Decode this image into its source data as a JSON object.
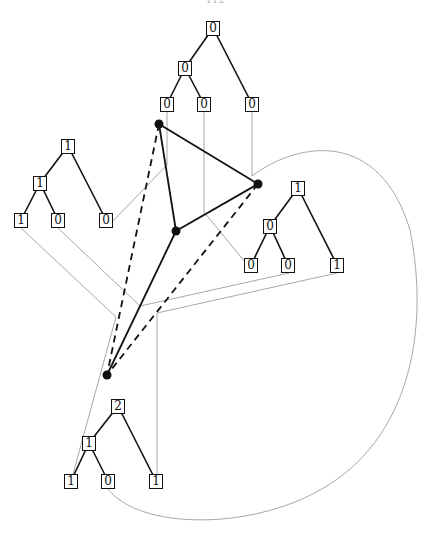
{
  "header": {
    "page_label": "112"
  },
  "colors": {
    "tree_edge": "#111111",
    "connector": "#a8a8a8",
    "graph_edge": "#111111",
    "vertex": "#111111"
  },
  "trees": [
    {
      "id": "top",
      "nodes": [
        {
          "label": "0",
          "x": 213,
          "y": 28
        },
        {
          "label": "0",
          "x": 185,
          "y": 68
        },
        {
          "label": "0",
          "x": 167,
          "y": 104
        },
        {
          "label": "0",
          "x": 204,
          "y": 104
        },
        {
          "label": "0",
          "x": 252,
          "y": 104
        }
      ],
      "edges": [
        [
          0,
          1
        ],
        [
          0,
          4
        ],
        [
          1,
          2
        ],
        [
          1,
          3
        ]
      ]
    },
    {
      "id": "left",
      "nodes": [
        {
          "label": "1",
          "x": 68,
          "y": 146
        },
        {
          "label": "1",
          "x": 40,
          "y": 183
        },
        {
          "label": "1",
          "x": 21,
          "y": 220
        },
        {
          "label": "0",
          "x": 58,
          "y": 220
        },
        {
          "label": "0",
          "x": 106,
          "y": 220
        }
      ],
      "edges": [
        [
          0,
          1
        ],
        [
          0,
          4
        ],
        [
          1,
          2
        ],
        [
          1,
          3
        ]
      ]
    },
    {
      "id": "right",
      "nodes": [
        {
          "label": "1",
          "x": 298,
          "y": 188
        },
        {
          "label": "0",
          "x": 270,
          "y": 226
        },
        {
          "label": "0",
          "x": 251,
          "y": 265
        },
        {
          "label": "0",
          "x": 288,
          "y": 265
        },
        {
          "label": "1",
          "x": 337,
          "y": 265
        }
      ],
      "edges": [
        [
          0,
          1
        ],
        [
          0,
          4
        ],
        [
          1,
          2
        ],
        [
          1,
          3
        ]
      ]
    },
    {
      "id": "bottom",
      "nodes": [
        {
          "label": "2",
          "x": 118,
          "y": 406
        },
        {
          "label": "1",
          "x": 89,
          "y": 443
        },
        {
          "label": "1",
          "x": 71,
          "y": 481
        },
        {
          "label": "0",
          "x": 108,
          "y": 481
        },
        {
          "label": "1",
          "x": 156,
          "y": 481
        }
      ],
      "edges": [
        [
          0,
          1
        ],
        [
          0,
          4
        ],
        [
          1,
          2
        ],
        [
          1,
          3
        ]
      ]
    }
  ],
  "vertices": [
    {
      "id": "A",
      "x": 159,
      "y": 124
    },
    {
      "id": "B",
      "x": 258,
      "y": 184
    },
    {
      "id": "C",
      "x": 176,
      "y": 231
    },
    {
      "id": "D",
      "x": 107,
      "y": 375
    }
  ],
  "graph_edges": [
    {
      "from": "A",
      "to": "B",
      "style": "solid"
    },
    {
      "from": "A",
      "to": "C",
      "style": "solid"
    },
    {
      "from": "B",
      "to": "C",
      "style": "solid"
    },
    {
      "from": "C",
      "to": "D",
      "style": "solid"
    },
    {
      "from": "A",
      "to": "D",
      "style": "dashed"
    },
    {
      "from": "B",
      "to": "D",
      "style": "dashed"
    }
  ],
  "connectors": [
    {
      "points": "167,112 167,165 112,222"
    },
    {
      "points": "204,112 204,212 245,262"
    },
    {
      "points": "21,228 116,317 73,474"
    },
    {
      "points": "58,228 140,306 289,273"
    },
    {
      "points": "337,273 157,313 157,474"
    }
  ],
  "curve": {
    "path": "M 252 112 L 252 176 C 300 140, 380 130, 410 230 C 430 330, 410 440, 320 490 C 250 530, 140 530, 108 489"
  }
}
